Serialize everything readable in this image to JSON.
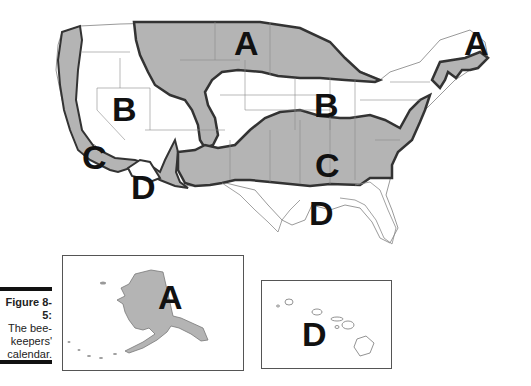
{
  "figure": {
    "number": "Figure 8-5:",
    "caption_lines": [
      "The bee-",
      "keepers'",
      "calendar."
    ]
  },
  "map": {
    "title": "Beekeepers' calendar zones of the United States",
    "zone_fill_color": "#b4b4b4",
    "boundary_color": "#333333",
    "state_line_color": "#8a8a8a",
    "labels": {
      "A_north": "A",
      "A_northeast": "A",
      "B_west": "B",
      "B_central": "B",
      "C_west": "C",
      "C_south": "C",
      "D_southwest": "D",
      "D_gulf": "D"
    },
    "insets": {
      "alaska": {
        "name": "Alaska",
        "label": "A"
      },
      "hawaii": {
        "name": "Hawaii",
        "label": "D"
      }
    }
  }
}
